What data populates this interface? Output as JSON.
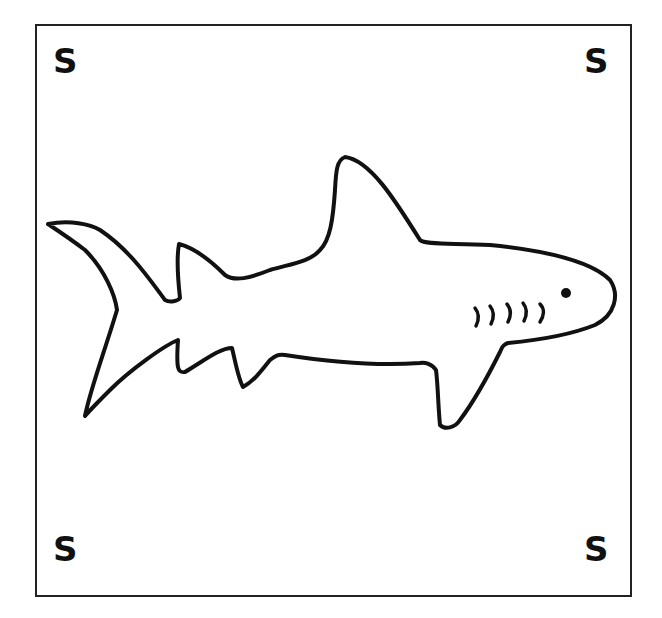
{
  "card": {
    "corner_labels": {
      "top_left": "S",
      "top_right": "S",
      "bottom_left": "S",
      "bottom_right": "S"
    },
    "illustration": "shark-outline",
    "colors": {
      "stroke": "#111111",
      "background": "#ffffff"
    }
  }
}
